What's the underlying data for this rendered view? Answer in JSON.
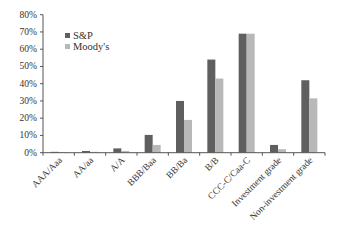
{
  "chart_data": {
    "type": "bar",
    "title": "",
    "xlabel": "",
    "ylabel": "",
    "ylim": [
      0,
      80
    ],
    "yticks": [
      "0%",
      "10%",
      "20%",
      "30%",
      "40%",
      "50%",
      "60%",
      "70%",
      "80%"
    ],
    "grid": false,
    "legend_position": "upper-left-inside",
    "categories": [
      "AAA/Aaa",
      "AA/aa",
      "A/A",
      "BBB/Baa",
      "BB/Ba",
      "B/B",
      "CCC-C/Caa-C",
      "Investment grade",
      "Non-investment grade"
    ],
    "series": [
      {
        "name": "S&P",
        "color": "#5f5f5f",
        "values": [
          0.5,
          1.0,
          2.5,
          10.3,
          30.0,
          54.0,
          69.0,
          4.5,
          42.0
        ]
      },
      {
        "name": "Moody's",
        "color": "#b8b8b8",
        "values": [
          0.3,
          0.5,
          1.0,
          4.5,
          19.0,
          43.0,
          69.0,
          2.0,
          31.5
        ]
      }
    ]
  },
  "legend": {
    "items": [
      {
        "label": "S&P",
        "color": "#5f5f5f"
      },
      {
        "label": "Moody's",
        "color": "#b8b8b8"
      }
    ]
  }
}
